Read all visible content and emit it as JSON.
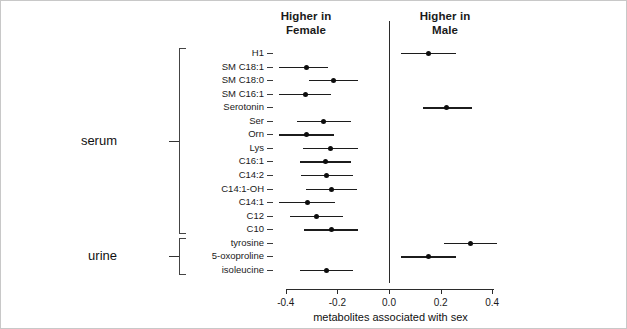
{
  "headers": {
    "left": "Higher in\nFemale",
    "left_line1": "Higher in",
    "left_line2": "Female",
    "right_line1": "Higher in",
    "right_line2": "Male"
  },
  "groups": [
    {
      "label": "serum",
      "count": 14
    },
    {
      "label": "urine",
      "count": 3
    }
  ],
  "axis": {
    "title": "metabolites associated with sex",
    "ticks": [
      "-0.4",
      "-0.2",
      "0.0",
      "0.2",
      "0.4"
    ],
    "tick_values": [
      -0.4,
      -0.2,
      0.0,
      0.2,
      0.4
    ]
  },
  "colors": {
    "point": "#0d0d0d",
    "line": "#1c1c1c",
    "zero_line": "#2b2b2b",
    "text": "#1a1a1a",
    "frame": "#c8c8c8",
    "background": "#ffffff"
  },
  "chart_data": {
    "type": "scatter",
    "title": "",
    "subtitle": "",
    "xlabel": "metabolites associated with sex",
    "ylabel": "",
    "xlim": [
      -0.48,
      0.48
    ],
    "grid": false,
    "legend": "none",
    "annotations": [
      "Higher in Female",
      "Higher in Male"
    ],
    "reference_line_x": 0.0,
    "xticks": [
      -0.4,
      -0.2,
      0.0,
      0.2,
      0.4
    ],
    "categories": [
      "H1",
      "SM C18:1",
      "SM C18:0",
      "SM C16:1",
      "Serotonin",
      "Ser",
      "Orn",
      "Lys",
      "C16:1",
      "C14:2",
      "C14:1-OH",
      "C14:1",
      "C12",
      "C10",
      "tyrosine",
      "5-oxoproline",
      "isoleucine"
    ],
    "group_of_category": [
      "serum",
      "serum",
      "serum",
      "serum",
      "serum",
      "serum",
      "serum",
      "serum",
      "serum",
      "serum",
      "serum",
      "serum",
      "serum",
      "serum",
      "urine",
      "urine",
      "urine"
    ],
    "points": [
      {
        "label": "H1",
        "group": "serum",
        "estimate": 0.155,
        "ci_low": 0.045,
        "ci_high": 0.258
      },
      {
        "label": "SM C18:1",
        "group": "serum",
        "estimate": -0.32,
        "ci_low": -0.425,
        "ci_high": -0.235
      },
      {
        "label": "SM C18:0",
        "group": "serum",
        "estimate": -0.215,
        "ci_low": -0.31,
        "ci_high": -0.12
      },
      {
        "label": "SM C16:1",
        "group": "serum",
        "estimate": -0.323,
        "ci_low": -0.425,
        "ci_high": -0.225
      },
      {
        "label": "Serotonin",
        "group": "serum",
        "estimate": 0.222,
        "ci_low": 0.13,
        "ci_high": 0.323
      },
      {
        "label": "Ser",
        "group": "serum",
        "estimate": -0.255,
        "ci_low": -0.358,
        "ci_high": -0.146
      },
      {
        "label": "Orn",
        "group": "serum",
        "estimate": -0.32,
        "ci_low": -0.428,
        "ci_high": -0.212
      },
      {
        "label": "Lys",
        "group": "serum",
        "estimate": -0.227,
        "ci_low": -0.335,
        "ci_high": -0.12
      },
      {
        "label": "C16:1",
        "group": "serum",
        "estimate": -0.246,
        "ci_low": -0.346,
        "ci_high": -0.146
      },
      {
        "label": "C14:2",
        "group": "serum",
        "estimate": -0.242,
        "ci_low": -0.342,
        "ci_high": -0.138
      },
      {
        "label": "C14:1-OH",
        "group": "serum",
        "estimate": -0.223,
        "ci_low": -0.323,
        "ci_high": -0.123
      },
      {
        "label": "C14:1",
        "group": "serum",
        "estimate": -0.315,
        "ci_low": -0.427,
        "ci_high": -0.208
      },
      {
        "label": "C12",
        "group": "serum",
        "estimate": -0.281,
        "ci_low": -0.385,
        "ci_high": -0.177
      },
      {
        "label": "C10",
        "group": "serum",
        "estimate": -0.223,
        "ci_low": -0.331,
        "ci_high": -0.119
      },
      {
        "label": "tyrosine",
        "group": "urine",
        "estimate": 0.315,
        "ci_low": 0.212,
        "ci_high": 0.419
      },
      {
        "label": "5-oxoproline",
        "group": "urine",
        "estimate": 0.154,
        "ci_low": 0.046,
        "ci_high": 0.258
      },
      {
        "label": "isoleucine",
        "group": "urine",
        "estimate": -0.242,
        "ci_low": -0.346,
        "ci_high": -0.138
      }
    ]
  }
}
